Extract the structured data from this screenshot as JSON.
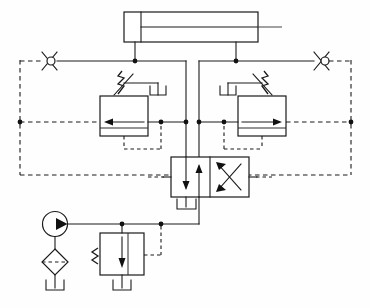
{
  "diagram": {
    "type": "hydraulic-schematic",
    "canvas": {
      "width": 370,
      "height": 308
    },
    "background_color": "#fefefe",
    "line_color": "#1a1a1a",
    "components": [
      {
        "id": "cylinder",
        "name": "double-acting-cylinder",
        "label": "",
        "x": 124,
        "y": 12,
        "width": 134,
        "height": 30,
        "ports": [
          "cap-end",
          "rod-end"
        ]
      },
      {
        "id": "check-valve-left",
        "name": "check-valve-left",
        "label": "",
        "cx": 49,
        "cy": 61,
        "direction": "left"
      },
      {
        "id": "check-valve-right",
        "name": "check-valve-right",
        "label": "",
        "cx": 322,
        "cy": 61,
        "direction": "right"
      },
      {
        "id": "counterbalance-valve-left",
        "name": "counterbalance-valve-left",
        "label": "",
        "x": 100,
        "y": 96,
        "width": 48,
        "height": 40,
        "flow_direction": "left",
        "has_spring": true,
        "has_pilot": true
      },
      {
        "id": "counterbalance-valve-right",
        "name": "counterbalance-valve-right",
        "label": "",
        "x": 238,
        "y": 96,
        "width": 48,
        "height": 40,
        "flow_direction": "right",
        "has_spring": true,
        "has_pilot": true
      },
      {
        "id": "directional-control-valve",
        "name": "directional-control-valve-4-2",
        "label": "",
        "x": 171,
        "y": 157,
        "width": 78,
        "height": 40,
        "positions": 2,
        "ways": 4
      },
      {
        "id": "pump",
        "name": "hydraulic-pump",
        "label": "",
        "cx": 55,
        "cy": 224,
        "r": 12.5,
        "direction": "right"
      },
      {
        "id": "filter",
        "name": "suction-filter",
        "label": "",
        "cx": 55,
        "cy": 262,
        "rx": 13,
        "ry": 13
      },
      {
        "id": "relief-valve",
        "name": "pressure-relief-valve",
        "label": "",
        "x": 100,
        "y": 233,
        "width": 44,
        "height": 42,
        "has_spring": true,
        "has_pilot": true
      },
      {
        "id": "tank-pump",
        "name": "reservoir-pump-suction",
        "label": "",
        "cx": 55,
        "cy": 290
      },
      {
        "id": "tank-relief",
        "name": "reservoir-relief-return",
        "label": "",
        "cx": 122,
        "cy": 290
      },
      {
        "id": "tank-dcv",
        "name": "reservoir-dcv-return",
        "label": "",
        "cx": 186,
        "cy": 207
      },
      {
        "id": "tank-drain-left",
        "name": "reservoir-drain-left",
        "label": "",
        "cx": 158,
        "cy": 90
      },
      {
        "id": "tank-drain-right",
        "name": "reservoir-drain-right",
        "label": "",
        "cx": 228,
        "cy": 90
      }
    ],
    "junctions": [
      {
        "name": "junction-cyl-cap",
        "x": 135,
        "y": 61
      },
      {
        "name": "junction-cyl-rod",
        "x": 236,
        "y": 61
      },
      {
        "name": "junction-left-rail",
        "x": 20,
        "y": 122
      },
      {
        "name": "junction-right-rail",
        "x": 351,
        "y": 122
      },
      {
        "name": "junction-cbv-left-out",
        "x": 161,
        "y": 122
      },
      {
        "name": "junction-cbv-left-line",
        "x": 186,
        "y": 122
      },
      {
        "name": "junction-cbv-right-line",
        "x": 199,
        "y": 122
      },
      {
        "name": "junction-cbv-right-out",
        "x": 224,
        "y": 122
      },
      {
        "name": "junction-pump-pressure",
        "x": 122,
        "y": 224
      },
      {
        "name": "junction-relief-pilot",
        "x": 161,
        "y": 224
      }
    ]
  }
}
